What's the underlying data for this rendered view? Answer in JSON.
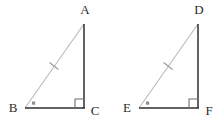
{
  "figure": {
    "background_color": "#ffffff",
    "leg_color": "#2f2f2f",
    "hypotenuse_color": "#b9b9b9",
    "marker_color": "#8f8f8f",
    "label_color": "#2b2b2b",
    "triangles": [
      {
        "name": "triangle-abc",
        "vertices": {
          "apex": {
            "label": "A",
            "x": 84,
            "y": 24,
            "label_x": 85,
            "label_y": 11
          },
          "left": {
            "label": "B",
            "x": 25,
            "y": 108,
            "label_x": 13,
            "label_y": 109
          },
          "right": {
            "label": "C",
            "x": 84,
            "y": 108,
            "label_x": 95,
            "label_y": 112
          }
        },
        "right_angle_at": "C",
        "marked_angle_at": "B",
        "hypotenuse": "AB",
        "hypotenuse_ticks": 1,
        "tick_midpoint": {
          "x": 54,
          "y": 66
        }
      },
      {
        "name": "triangle-def",
        "vertices": {
          "apex": {
            "label": "D",
            "x": 198,
            "y": 24,
            "label_x": 199,
            "label_y": 11
          },
          "left": {
            "label": "E",
            "x": 139,
            "y": 108,
            "label_x": 127,
            "label_y": 109
          },
          "right": {
            "label": "F",
            "x": 198,
            "y": 108,
            "label_x": 209,
            "label_y": 112
          }
        },
        "right_angle_at": "F",
        "marked_angle_at": "E",
        "hypotenuse": "DE",
        "hypotenuse_ticks": 1,
        "tick_midpoint": {
          "x": 168,
          "y": 66
        }
      }
    ]
  }
}
